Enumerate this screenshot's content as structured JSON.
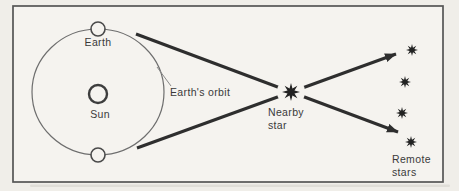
{
  "colors": {
    "paper": "#f0eee9",
    "ink": "#2e2e2e",
    "text": "#3a3a3a"
  },
  "labels": {
    "earth": "Earth",
    "sun": "Sun",
    "earths_orbit": "Earth's orbit",
    "nearby_star": {
      "line1": "Nearby",
      "line2": "star"
    },
    "remote_stars": {
      "line1": "Remote",
      "line2": "stars"
    }
  },
  "diagram_data": {
    "type": "diagram",
    "subject": "stellar-parallax",
    "frame": {
      "x": 13,
      "y": 6,
      "width": 430,
      "height": 176
    },
    "orbit": {
      "cx": 98,
      "cy": 92,
      "rx": 66,
      "ry": 63
    },
    "sun": {
      "cx": 98,
      "cy": 94,
      "r": 9
    },
    "earth_positions": [
      {
        "cx": 98,
        "cy": 29,
        "r": 7
      },
      {
        "cx": 98,
        "cy": 155,
        "r": 7
      }
    ],
    "orbit_pointer": {
      "x1": 157,
      "y1": 67,
      "x2": 171,
      "y2": 86
    },
    "sight_lines": [
      {
        "x1": 136,
        "y1": 34,
        "x2": 398,
        "y2": 132
      },
      {
        "x1": 137,
        "y1": 148,
        "x2": 396,
        "y2": 54
      }
    ],
    "nearby_star": {
      "x": 291,
      "y": 92,
      "r": 9,
      "halo": 14
    },
    "remote_stars": [
      {
        "x": 412,
        "y": 50,
        "r": 6
      },
      {
        "x": 405,
        "y": 82,
        "r": 6
      },
      {
        "x": 402,
        "y": 113,
        "r": 6
      },
      {
        "x": 411,
        "y": 142,
        "r": 6
      }
    ]
  }
}
